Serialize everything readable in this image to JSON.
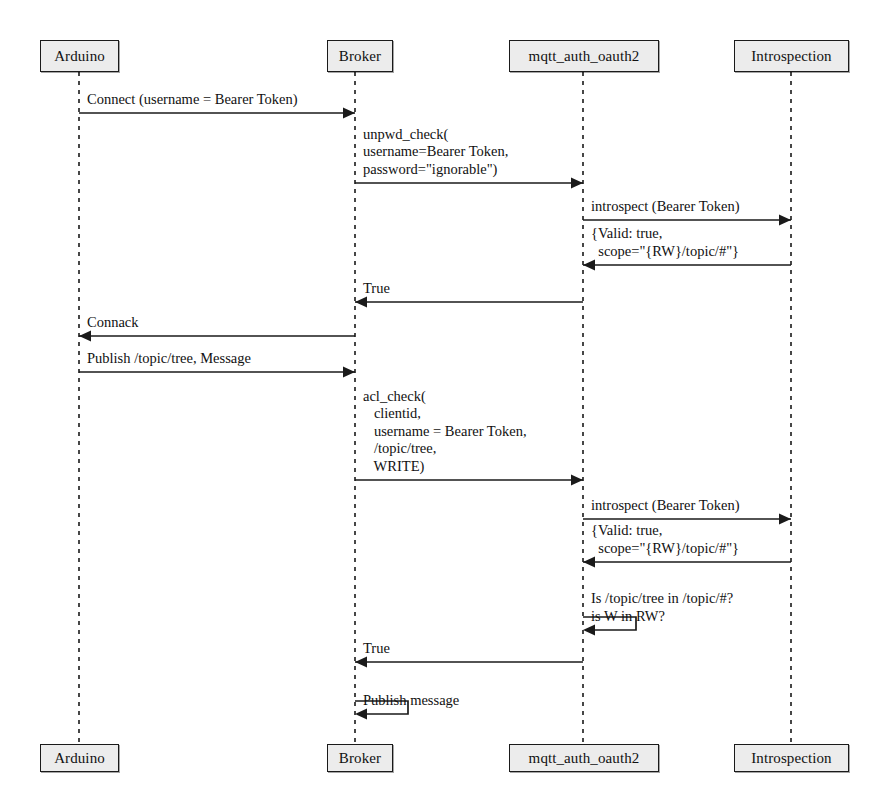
{
  "diagram": {
    "type": "uml-sequence-diagram",
    "title_fragment": "",
    "colors": {
      "box_fill": "#ececec",
      "box_border": "#1a1a1a",
      "line": "#1a1a1a",
      "text": "#111111",
      "background": "#ffffff"
    },
    "participants": [
      {
        "id": "arduino",
        "label": "Arduino",
        "lifeline_x": 79,
        "box_left": 40,
        "box_width": 79
      },
      {
        "id": "broker",
        "label": "Broker",
        "lifeline_x": 355,
        "box_left": 327,
        "box_width": 66
      },
      {
        "id": "mqtt_auth_oauth2",
        "label": "mqtt_auth_oauth2",
        "lifeline_x": 583,
        "box_left": 509,
        "box_width": 150
      },
      {
        "id": "introspection",
        "label": "Introspection",
        "lifeline_x": 791,
        "box_left": 734,
        "box_width": 115
      }
    ],
    "messages": [
      {
        "index": 1,
        "from": "arduino",
        "to": "broker",
        "direction": "right",
        "kind": "call",
        "arrow_y": 113,
        "lines": [
          "Connect (username = Bearer Token)"
        ]
      },
      {
        "index": 2,
        "from": "broker",
        "to": "mqtt_auth_oauth2",
        "direction": "right",
        "kind": "call",
        "arrow_y": 183,
        "lines": [
          "unpwd_check(",
          "username=Bearer Token,",
          "password=\"ignorable\")"
        ]
      },
      {
        "index": 3,
        "from": "mqtt_auth_oauth2",
        "to": "introspection",
        "direction": "right",
        "kind": "call",
        "arrow_y": 220,
        "lines": [
          "introspect (Bearer Token)"
        ]
      },
      {
        "index": 4,
        "from": "introspection",
        "to": "mqtt_auth_oauth2",
        "direction": "left",
        "kind": "return",
        "arrow_y": 265,
        "lines": [
          "{Valid: true,",
          "  scope=\"{RW}/topic/#\"}"
        ]
      },
      {
        "index": 5,
        "from": "mqtt_auth_oauth2",
        "to": "broker",
        "direction": "left",
        "kind": "return",
        "arrow_y": 302,
        "lines": [
          "True"
        ]
      },
      {
        "index": 6,
        "from": "broker",
        "to": "arduino",
        "direction": "left",
        "kind": "return",
        "arrow_y": 336,
        "lines": [
          "Connack"
        ]
      },
      {
        "index": 7,
        "from": "arduino",
        "to": "broker",
        "direction": "right",
        "kind": "call",
        "arrow_y": 372,
        "lines": [
          "Publish /topic/tree, Message"
        ]
      },
      {
        "index": 8,
        "from": "broker",
        "to": "mqtt_auth_oauth2",
        "direction": "right",
        "kind": "call",
        "arrow_y": 480,
        "lines": [
          "acl_check(",
          "   clientid,",
          "   username = Bearer Token,",
          "   /topic/tree,",
          "   WRITE)"
        ]
      },
      {
        "index": 9,
        "from": "mqtt_auth_oauth2",
        "to": "introspection",
        "direction": "right",
        "kind": "call",
        "arrow_y": 519,
        "lines": [
          "introspect (Bearer Token)"
        ]
      },
      {
        "index": 10,
        "from": "introspection",
        "to": "mqtt_auth_oauth2",
        "direction": "left",
        "kind": "return",
        "arrow_y": 562,
        "lines": [
          "{Valid: true,",
          "  scope=\"{RW}/topic/#\"}"
        ]
      },
      {
        "index": 11,
        "from": "mqtt_auth_oauth2",
        "to": "mqtt_auth_oauth2",
        "direction": "self",
        "kind": "self-call",
        "arrow_y": 630,
        "self_top_y": 617,
        "self_width": 53,
        "lines": [
          "Is /topic/tree in /topic/#?",
          "is W in RW?"
        ]
      },
      {
        "index": 12,
        "from": "mqtt_auth_oauth2",
        "to": "broker",
        "direction": "left",
        "kind": "return",
        "arrow_y": 662,
        "lines": [
          "True"
        ]
      },
      {
        "index": 13,
        "from": "broker",
        "to": "broker",
        "direction": "self",
        "kind": "self-call",
        "arrow_y": 714,
        "self_top_y": 701,
        "self_width": 53,
        "lines": [
          "Publish message"
        ]
      }
    ],
    "lifeline": {
      "top_y": 72,
      "bottom_y": 744
    },
    "header_boxes_y": 40,
    "header_boxes_height": 32,
    "footer_boxes_y": 744,
    "footer_boxes_height": 28
  }
}
